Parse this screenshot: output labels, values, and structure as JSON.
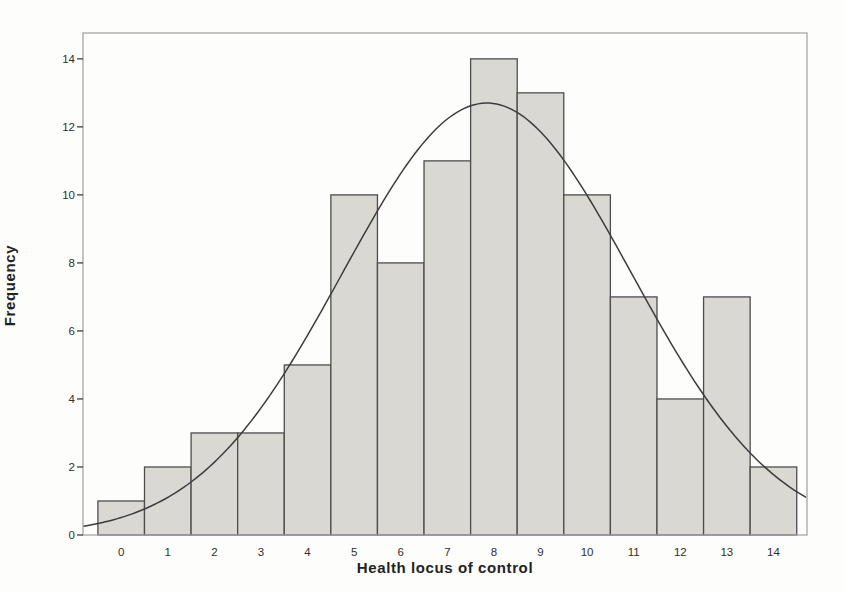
{
  "chart_data": {
    "type": "bar",
    "subtype": "histogram",
    "title": "",
    "xlabel": "Health locus of control",
    "ylabel": "Frequency",
    "categories": [
      0,
      1,
      2,
      3,
      4,
      5,
      6,
      7,
      8,
      9,
      10,
      11,
      12,
      13,
      14
    ],
    "values": [
      1,
      2,
      3,
      3,
      5,
      10,
      8,
      11,
      14,
      13,
      10,
      7,
      4,
      7,
      2
    ],
    "bin_width": 1,
    "xlim": [
      -0.82,
      14.72
    ],
    "ylim": [
      0,
      14.76
    ],
    "yticks": [
      0,
      2,
      4,
      6,
      8,
      10,
      12,
      14
    ],
    "grid": false,
    "legend": false,
    "normal_curve": {
      "mean": 7.85,
      "sd": 3.1,
      "peak": 12.7
    },
    "colors": {
      "bar_fill": "#d9d8d3",
      "bar_border": "#4d4d4d",
      "frame": "#a6a6a6",
      "curve": "#3c3c3c",
      "tick_text": "#2f2f2f",
      "background": "#fdfdfc"
    }
  }
}
